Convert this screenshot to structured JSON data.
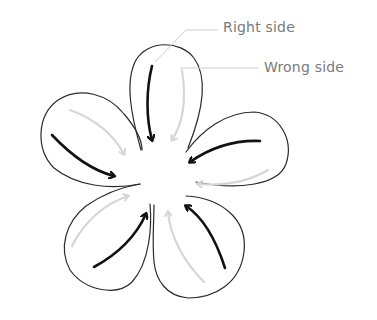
{
  "diagram": {
    "type": "flower-petal-direction-guide",
    "petal_count": 5,
    "labels": {
      "right_side": "Right side",
      "wrong_side": "Wrong side"
    },
    "legend": [
      {
        "label": "Right side",
        "arrow_style": "dark",
        "color": "#111111"
      },
      {
        "label": "Wrong side",
        "arrow_style": "light",
        "color": "#d6d6d6"
      }
    ],
    "colors": {
      "outline": "#2b2b2b",
      "right_arrow": "#111111",
      "wrong_arrow": "#d6d6d6",
      "leader_line": "#cfcfcf",
      "label_text": "#7a7a7a"
    }
  }
}
